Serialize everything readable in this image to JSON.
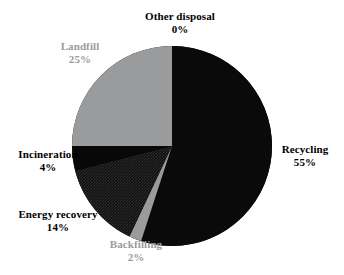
{
  "chart_data": {
    "type": "pie",
    "title": "",
    "subtitle": "",
    "xlabel": "",
    "ylabel": "",
    "legend_position": "none",
    "grid": false,
    "units": "percent",
    "start_angle_deg": 0,
    "direction": "clockwise",
    "categories": [
      "Recycling",
      "Backfilling",
      "Energy recovery",
      "Incineration",
      "Landfill",
      "Other disposal"
    ],
    "values": [
      55,
      2,
      14,
      4,
      25,
      0
    ],
    "slices": [
      {
        "name": "Recycling",
        "value": 55,
        "value_label": "55%",
        "color": "#0a0a0a",
        "fill_style": "solid-black",
        "label_color": "#000000",
        "start_deg": 0,
        "end_deg": 198
      },
      {
        "name": "Backfilling",
        "value": 2,
        "value_label": "2%",
        "color": "#9a9b9c",
        "fill_style": "solid-gray",
        "label_color": "#9a9b9c",
        "start_deg": 198,
        "end_deg": 205.2
      },
      {
        "name": "Energy recovery",
        "value": 14,
        "value_label": "14%",
        "color": "#1c1c1c",
        "fill_style": "dark-textured",
        "label_color": "#000000",
        "start_deg": 205.2,
        "end_deg": 255.6
      },
      {
        "name": "Incineration",
        "value": 4,
        "value_label": "4%",
        "color": "#080808",
        "fill_style": "solid-black",
        "label_color": "#000000",
        "start_deg": 255.6,
        "end_deg": 270
      },
      {
        "name": "Landfill",
        "value": 25,
        "value_label": "25%",
        "color": "#9a9b9c",
        "fill_style": "solid-gray",
        "label_color": "#9a9b9c",
        "start_deg": 270,
        "end_deg": 360
      },
      {
        "name": "Other disposal",
        "value": 0,
        "value_label": "0%",
        "color": "#9a9b9c",
        "fill_style": "none",
        "label_color": "#000000",
        "start_deg": 360,
        "end_deg": 360
      }
    ],
    "geometry": {
      "center_x": 172,
      "center_y": 146,
      "radius": 100
    },
    "background_color": "#ffffff"
  },
  "labels": {
    "other_disposal": {
      "name": "Other disposal",
      "value": "0%"
    },
    "landfill": {
      "name": "Landfill",
      "value": "25%"
    },
    "recycling": {
      "name": "Recycling",
      "value": "55%"
    },
    "incineration": {
      "name": "Incineration",
      "value": "4%"
    },
    "energy_recovery": {
      "name": "Energy recovery",
      "value": "14%"
    },
    "backfilling": {
      "name": "Backfilling",
      "value": "2%"
    }
  }
}
